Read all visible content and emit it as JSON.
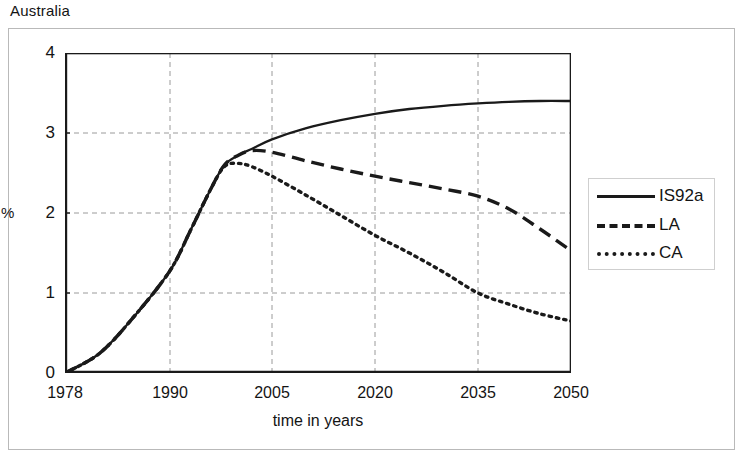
{
  "chart_title": "Australia",
  "legend": {
    "entries": [
      {
        "label": "IS92a",
        "style": "solid"
      },
      {
        "label": "LA",
        "style": "dashed"
      },
      {
        "label": "CA",
        "style": "dotted"
      }
    ]
  },
  "axes": {
    "x_title": "time in years",
    "y_title": "%",
    "x_ticks": [
      "1978",
      "1990",
      "2005",
      "2020",
      "2035",
      "2050"
    ],
    "y_ticks": [
      "0",
      "1",
      "2",
      "3",
      "4"
    ]
  },
  "colors": {
    "line": "#1a1a1a",
    "grid": "#9a9a9a",
    "frame": "#b9b9b9",
    "axis": "#1a1a1a",
    "background": "#ffffff"
  },
  "chart_data": {
    "type": "line",
    "title": "Australia",
    "xlabel": "time in years",
    "ylabel": "%",
    "xlim": [
      1978,
      2050
    ],
    "ylim": [
      0,
      4
    ],
    "grid": true,
    "legend_position": "right",
    "x_tick_values": [
      1978,
      1990,
      2005,
      2020,
      2035,
      2050
    ],
    "y_tick_values": [
      0,
      1,
      2,
      3,
      4
    ],
    "x": [
      1978,
      1982,
      1986,
      1990,
      1993,
      1996,
      1998,
      2000,
      2002,
      2005,
      2010,
      2015,
      2020,
      2025,
      2030,
      2035,
      2040,
      2045,
      2050
    ],
    "series": [
      {
        "name": "IS92a",
        "style": "solid",
        "values": [
          0.0,
          0.25,
          0.72,
          1.28,
          1.78,
          2.3,
          2.6,
          2.72,
          2.8,
          2.92,
          3.06,
          3.16,
          3.24,
          3.3,
          3.34,
          3.37,
          3.39,
          3.4,
          3.4
        ]
      },
      {
        "name": "LA",
        "style": "dashed",
        "values": [
          0.0,
          0.25,
          0.72,
          1.28,
          1.78,
          2.3,
          2.6,
          2.72,
          2.78,
          2.76,
          2.65,
          2.55,
          2.46,
          2.38,
          2.3,
          2.21,
          2.05,
          1.8,
          1.53
        ]
      },
      {
        "name": "CA",
        "style": "dotted",
        "values": [
          0.0,
          0.25,
          0.72,
          1.28,
          1.78,
          2.3,
          2.58,
          2.62,
          2.58,
          2.46,
          2.22,
          1.97,
          1.72,
          1.5,
          1.26,
          1.0,
          0.86,
          0.74,
          0.65
        ]
      }
    ]
  }
}
